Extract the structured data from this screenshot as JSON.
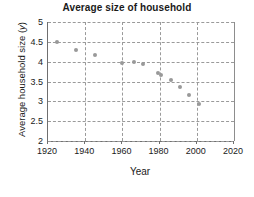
{
  "chart_data": {
    "type": "scatter",
    "title": "Average size of household",
    "xlabel": "Year",
    "ylabel": "Average household size (y)",
    "ylabel_text": "Average household size (",
    "ylabel_var": "y",
    "ylabel_close": ")",
    "xlim": [
      1920,
      2020
    ],
    "ylim": [
      2,
      5
    ],
    "grid": true,
    "legend": "none",
    "xticks": [
      1920,
      1940,
      1960,
      1980,
      2000,
      2020
    ],
    "yticks": [
      2,
      2.5,
      3,
      3.5,
      4,
      4.5,
      5
    ],
    "xtick_labels": [
      "1920",
      "1940",
      "1960",
      "1980",
      "2000",
      "2020"
    ],
    "ytick_labels": [
      "2",
      "2.5",
      "3",
      "3.5",
      "4",
      "4.5",
      "5"
    ],
    "series": [
      {
        "name": "Average household size",
        "marker": "circle",
        "color": "#999999",
        "points": [
          {
            "x": 1925,
            "y": 4.5
          },
          {
            "x": 1935,
            "y": 4.3
          },
          {
            "x": 1945,
            "y": 4.17
          },
          {
            "x": 1960,
            "y": 3.97
          },
          {
            "x": 1966,
            "y": 4.0
          },
          {
            "x": 1971,
            "y": 3.93
          },
          {
            "x": 1979,
            "y": 3.72
          },
          {
            "x": 1981,
            "y": 3.67
          },
          {
            "x": 1986,
            "y": 3.54
          },
          {
            "x": 1991,
            "y": 3.35
          },
          {
            "x": 1996,
            "y": 3.15
          },
          {
            "x": 2001,
            "y": 2.93
          }
        ]
      }
    ]
  },
  "colors": {
    "marker": "#999999",
    "grid": "#9a9a9a",
    "axis": "#6f6f6f",
    "text": "#1a1a1a",
    "background": "#ffffff"
  }
}
